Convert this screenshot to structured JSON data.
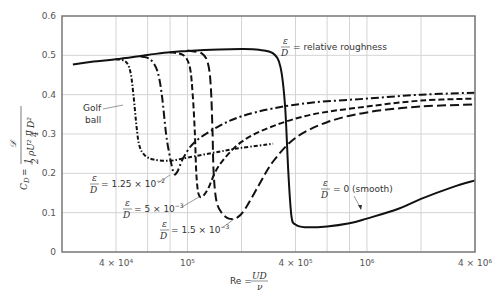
{
  "chart_data": {
    "type": "line",
    "title": "",
    "xlabel": "Re = UD/ν",
    "ylabel": "C_D = 𝒟 / (½ ρU² (π/4) D²)",
    "xscale": "log",
    "xlim": [
      20000,
      4000000
    ],
    "ylim": [
      0,
      0.6
    ],
    "grid": true,
    "x_ticks": [
      {
        "value": 40000,
        "label": "4 × 10⁴"
      },
      {
        "value": 100000,
        "label": "10⁵"
      },
      {
        "value": 400000,
        "label": "4 × 10⁵"
      },
      {
        "value": 1000000,
        "label": "10⁶"
      },
      {
        "value": 4000000,
        "label": "4 × 10⁶"
      }
    ],
    "x_gridlines": [
      40000,
      60000,
      80000,
      100000,
      200000,
      400000,
      600000,
      800000,
      1000000,
      2000000,
      4000000
    ],
    "y_ticks": [
      0,
      0.1,
      0.2,
      0.3,
      0.4,
      0.5,
      0.6
    ],
    "y_tick_labels": [
      "0",
      "0.1",
      "0.2",
      "0.3",
      "0.4",
      "0.5",
      "0.6"
    ],
    "series": [
      {
        "name": "ε/D = 0 (smooth)",
        "style": "solid",
        "points": [
          [
            23000,
            0.477
          ],
          [
            30000,
            0.484
          ],
          [
            40000,
            0.49
          ],
          [
            60000,
            0.501
          ],
          [
            80000,
            0.508
          ],
          [
            100000,
            0.511
          ],
          [
            150000,
            0.515
          ],
          [
            200000,
            0.516
          ],
          [
            250000,
            0.514
          ],
          [
            300000,
            0.505
          ],
          [
            330000,
            0.47
          ],
          [
            350000,
            0.37
          ],
          [
            365000,
            0.2
          ],
          [
            380000,
            0.09
          ],
          [
            400000,
            0.07
          ],
          [
            450000,
            0.063
          ],
          [
            600000,
            0.065
          ],
          [
            800000,
            0.073
          ],
          [
            1000000,
            0.085
          ],
          [
            1500000,
            0.11
          ],
          [
            2000000,
            0.135
          ],
          [
            3000000,
            0.165
          ],
          [
            4000000,
            0.182
          ]
        ]
      },
      {
        "name": "ε/D = 1.5 × 10⁻³",
        "style": "long-dash",
        "points": [
          [
            100000,
            0.512
          ],
          [
            120000,
            0.505
          ],
          [
            130000,
            0.48
          ],
          [
            135000,
            0.42
          ],
          [
            138000,
            0.3
          ],
          [
            140000,
            0.2
          ],
          [
            145000,
            0.13
          ],
          [
            155000,
            0.1
          ],
          [
            170000,
            0.085
          ],
          [
            190000,
            0.088
          ],
          [
            210000,
            0.11
          ],
          [
            250000,
            0.17
          ],
          [
            300000,
            0.23
          ],
          [
            400000,
            0.29
          ],
          [
            600000,
            0.33
          ],
          [
            1000000,
            0.355
          ],
          [
            2000000,
            0.37
          ],
          [
            4000000,
            0.375
          ]
        ]
      },
      {
        "name": "ε/D = 5 × 10⁻³",
        "style": "short-dash",
        "points": [
          [
            80000,
            0.508
          ],
          [
            95000,
            0.5
          ],
          [
            103000,
            0.47
          ],
          [
            107000,
            0.4
          ],
          [
            110000,
            0.3
          ],
          [
            112000,
            0.2
          ],
          [
            115000,
            0.15
          ],
          [
            120000,
            0.14
          ],
          [
            130000,
            0.16
          ],
          [
            150000,
            0.22
          ],
          [
            200000,
            0.28
          ],
          [
            300000,
            0.32
          ],
          [
            500000,
            0.35
          ],
          [
            1000000,
            0.37
          ],
          [
            2000000,
            0.385
          ],
          [
            4000000,
            0.39
          ]
        ]
      },
      {
        "name": "ε/D = 1.25 × 10⁻²",
        "style": "dash-dot",
        "points": [
          [
            55000,
            0.497
          ],
          [
            62000,
            0.49
          ],
          [
            68000,
            0.46
          ],
          [
            72000,
            0.4
          ],
          [
            76000,
            0.3
          ],
          [
            80000,
            0.24
          ],
          [
            84000,
            0.2
          ],
          [
            88000,
            0.205
          ],
          [
            95000,
            0.24
          ],
          [
            110000,
            0.28
          ],
          [
            150000,
            0.32
          ],
          [
            200000,
            0.345
          ],
          [
            300000,
            0.365
          ],
          [
            500000,
            0.38
          ],
          [
            1000000,
            0.39
          ],
          [
            2000000,
            0.4
          ],
          [
            4000000,
            0.405
          ]
        ]
      },
      {
        "name": "Golf ball",
        "style": "dotted-dash",
        "points": [
          [
            40000,
            0.49
          ],
          [
            45000,
            0.485
          ],
          [
            48000,
            0.46
          ],
          [
            50000,
            0.4
          ],
          [
            52000,
            0.32
          ],
          [
            54000,
            0.27
          ],
          [
            58000,
            0.245
          ],
          [
            65000,
            0.235
          ],
          [
            80000,
            0.232
          ],
          [
            100000,
            0.24
          ],
          [
            150000,
            0.255
          ],
          [
            200000,
            0.265
          ],
          [
            300000,
            0.275
          ]
        ]
      }
    ],
    "annotations": [
      {
        "text": "ε/D = relative roughness"
      },
      {
        "text": "Golf ball"
      },
      {
        "text": "ε/D = 1.25 × 10⁻²"
      },
      {
        "text": "ε/D = 5 × 10⁻³"
      },
      {
        "text": "ε/D = 1.5 × 10⁻³"
      },
      {
        "text": "ε/D = 0 (smooth)"
      }
    ]
  },
  "labels": {
    "golf_line1": "Golf",
    "golf_line2": "ball",
    "rr_eq": "= relative roughness",
    "r125": "= 1.25 × 10",
    "r125_exp": "−2",
    "r5": "= 5 × 10",
    "r5_exp": "−3",
    "r15": "= 1.5 × 10",
    "r15_exp": "−3",
    "smooth": "= 0 (smooth)",
    "eps": "ε",
    "D": "D",
    "re": "Re =",
    "UD": "UD",
    "nu": "ν",
    "cd": "C",
    "cd_sub": "D",
    "cd_eq": "="
  }
}
